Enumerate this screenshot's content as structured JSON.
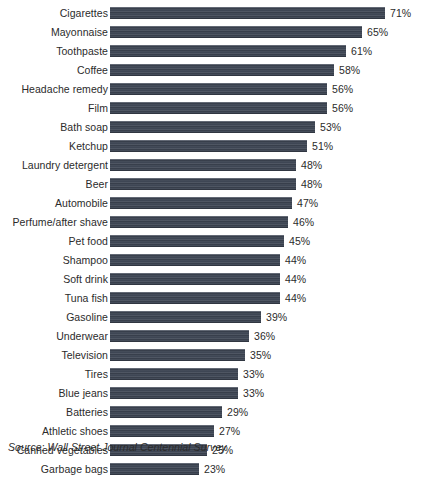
{
  "source_note": "Source: Wall Street Journal Centennial Survey",
  "chart_data": {
    "type": "bar",
    "orientation": "horizontal",
    "title": "",
    "subtitle": "",
    "xlabel": "",
    "ylabel": "",
    "xlim": [
      0,
      71
    ],
    "grid": false,
    "legend": false,
    "value_suffix": "%",
    "bar_color": "#3e4654",
    "text_color": "#2b2b2b",
    "background_color": "#ffffff",
    "categories": [
      "Cigarettes",
      "Mayonnaise",
      "Toothpaste",
      "Coffee",
      "Headache remedy",
      "Film",
      "Bath soap",
      "Ketchup",
      "Laundry detergent",
      "Beer",
      "Automobile",
      "Perfume/after shave",
      "Pet food",
      "Shampoo",
      "Soft drink",
      "Tuna fish",
      "Gasoline",
      "Underwear",
      "Television",
      "Tires",
      "Blue jeans",
      "Batteries",
      "Athletic shoes",
      "Canned vegetables",
      "Garbage bags"
    ],
    "values": [
      71,
      65,
      61,
      58,
      56,
      56,
      53,
      51,
      48,
      48,
      47,
      46,
      45,
      44,
      44,
      44,
      39,
      36,
      35,
      33,
      33,
      29,
      27,
      25,
      23
    ],
    "value_labels": [
      "71%",
      "65%",
      "61%",
      "58%",
      "56%",
      "56%",
      "53%",
      "51%",
      "48%",
      "48%",
      "47%",
      "46%",
      "45%",
      "44%",
      "44%",
      "44%",
      "39%",
      "36%",
      "35%",
      "33%",
      "33%",
      "29%",
      "27%",
      "25%",
      "23%"
    ]
  }
}
